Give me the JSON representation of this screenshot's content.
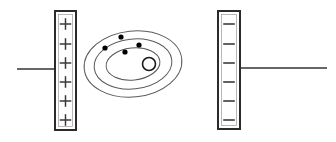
{
  "diagram": {
    "canvas": {
      "width": 336,
      "height": 142,
      "background": "#ffffff"
    },
    "colors": {
      "stroke": "#2b2b2b",
      "orbit_stroke": "#5a5a5a",
      "plate_fill": "#ffffff",
      "electron_fill": "#000000",
      "wire": "#333333"
    },
    "positive_plate": {
      "label": "positive plate",
      "sign": "+",
      "sign_count": 6,
      "x": 55,
      "y": 11,
      "width": 21,
      "height": 119,
      "border_width": 2,
      "sign_positions_y": [
        24,
        44,
        63,
        82,
        101,
        120
      ]
    },
    "negative_plate": {
      "label": "negative plate",
      "sign": "−",
      "sign_count": 6,
      "x": 218,
      "y": 11,
      "width": 22,
      "height": 118,
      "border_width": 2,
      "sign_positions_y": [
        24,
        44,
        63,
        82,
        101,
        120
      ]
    },
    "left_wire": {
      "label": "left lead wire",
      "x1": 17,
      "y1": 69,
      "x2": 56,
      "y2": 69,
      "width": 1.6
    },
    "right_wire": {
      "label": "right lead wire",
      "x1": 239,
      "y1": 68,
      "x2": 327,
      "y2": 68,
      "width": 1.6
    },
    "atom": {
      "label": "atom with electron shells",
      "center_x": 133,
      "center_y": 64,
      "orbits": [
        {
          "name": "outer-shell",
          "rx": 49,
          "ry": 33,
          "rotation": -6
        },
        {
          "name": "middle-shell",
          "rx": 39,
          "ry": 25,
          "rotation": -6
        },
        {
          "name": "inner-shell",
          "rx": 27,
          "ry": 16,
          "rotation": -6
        }
      ],
      "nucleus": {
        "name": "nucleus",
        "cx": 149,
        "cy": 64,
        "r": 6.5,
        "stroke_width": 1.6
      },
      "electrons": [
        {
          "name": "electron-1",
          "cx": 121,
          "cy": 37,
          "r": 2.6
        },
        {
          "name": "electron-2",
          "cx": 139,
          "cy": 45,
          "r": 2.6
        },
        {
          "name": "electron-3",
          "cx": 105,
          "cy": 48,
          "r": 2.6
        },
        {
          "name": "electron-4",
          "cx": 125,
          "cy": 52,
          "r": 2.6
        }
      ]
    }
  }
}
